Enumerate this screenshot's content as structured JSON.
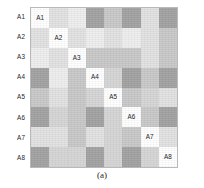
{
  "figure": {
    "caption": "(a)",
    "row_labels": [
      "A1",
      "A2",
      "A3",
      "A4",
      "A5",
      "A6",
      "A7",
      "A8"
    ],
    "diagonal_labels": [
      "A1",
      "A2",
      "A3",
      "A4",
      "A5",
      "A6",
      "A7",
      "A8"
    ],
    "colors": {
      "white": "#ffffff",
      "very_light": "#eeeeee",
      "light": "#e2e2e2",
      "light_medium": "#d6d6d6",
      "medium": "#c9c9c9",
      "medium_dark": "#bdbdbd",
      "dark": "#a3a3a3",
      "border": "#b9b9b9",
      "text": "#25252a"
    }
  },
  "chart_data": {
    "type": "heatmap",
    "title": "",
    "subtitle": "",
    "xlabel": "",
    "ylabel": "",
    "caption": "(a)",
    "grid": true,
    "legend": "none",
    "rows": 8,
    "cols": 8,
    "row_categories": [
      "A1",
      "A2",
      "A3",
      "A4",
      "A5",
      "A6",
      "A7",
      "A8"
    ],
    "col_categories": [
      "A1",
      "A2",
      "A3",
      "A4",
      "A5",
      "A6",
      "A7",
      "A8"
    ],
    "value_range": [
      0,
      1
    ],
    "colormap": "grayscale (0 = dark gray, 1 = white)",
    "cell_labels": [
      [
        "A1",
        "",
        "",
        "",
        "",
        "",
        "",
        ""
      ],
      [
        "",
        "A2",
        "",
        "",
        "",
        "",
        "",
        ""
      ],
      [
        "",
        "",
        "A3",
        "",
        "",
        "",
        "",
        ""
      ],
      [
        "",
        "",
        "",
        "A4",
        "",
        "",
        "",
        ""
      ],
      [
        "",
        "",
        "",
        "",
        "A5",
        "",
        "",
        ""
      ],
      [
        "",
        "",
        "",
        "",
        "",
        "A6",
        "",
        ""
      ],
      [
        "",
        "",
        "",
        "",
        "",
        "",
        "A7",
        ""
      ],
      [
        "",
        "",
        "",
        "",
        "",
        "",
        "",
        "A8"
      ]
    ],
    "values": [
      [
        1.0,
        0.82,
        0.93,
        0.4,
        0.74,
        0.4,
        0.82,
        0.4
      ],
      [
        0.82,
        1.0,
        0.82,
        0.93,
        0.82,
        0.93,
        0.82,
        0.74
      ],
      [
        0.93,
        0.82,
        1.0,
        0.74,
        0.74,
        0.74,
        0.82,
        0.74
      ],
      [
        0.4,
        0.93,
        0.74,
        1.0,
        0.88,
        0.4,
        0.74,
        0.4
      ],
      [
        0.74,
        0.82,
        0.74,
        0.88,
        1.0,
        0.74,
        0.88,
        0.82
      ],
      [
        0.4,
        0.88,
        0.74,
        0.4,
        0.88,
        1.0,
        0.74,
        0.4
      ],
      [
        0.82,
        0.82,
        0.74,
        0.82,
        0.88,
        0.74,
        1.0,
        0.82
      ],
      [
        0.4,
        0.88,
        0.88,
        0.4,
        0.88,
        0.4,
        0.88,
        1.0
      ]
    ],
    "cell_colors": [
      [
        "#ffffff",
        "#e2e2e2",
        "#eeeeee",
        "#a3a3a3",
        "#c9c9c9",
        "#a3a3a3",
        "#e2e2e2",
        "#a3a3a3"
      ],
      [
        "#e2e2e2",
        "#ffffff",
        "#e2e2e2",
        "#eeeeee",
        "#e2e2e2",
        "#eeeeee",
        "#e2e2e2",
        "#c9c9c9"
      ],
      [
        "#eeeeee",
        "#e2e2e2",
        "#ffffff",
        "#c9c9c9",
        "#c9c9c9",
        "#c9c9c9",
        "#e2e2e2",
        "#c9c9c9"
      ],
      [
        "#a3a3a3",
        "#eeeeee",
        "#c9c9c9",
        "#ffffff",
        "#d6d6d6",
        "#a3a3a3",
        "#c9c9c9",
        "#a3a3a3"
      ],
      [
        "#c9c9c9",
        "#e2e2e2",
        "#c9c9c9",
        "#d6d6d6",
        "#ffffff",
        "#c9c9c9",
        "#d6d6d6",
        "#e2e2e2"
      ],
      [
        "#a3a3a3",
        "#d6d6d6",
        "#c9c9c9",
        "#a3a3a3",
        "#d6d6d6",
        "#ffffff",
        "#c9c9c9",
        "#a3a3a3"
      ],
      [
        "#e2e2e2",
        "#e2e2e2",
        "#c9c9c9",
        "#e2e2e2",
        "#d6d6d6",
        "#c9c9c9",
        "#ffffff",
        "#e2e2e2"
      ],
      [
        "#a3a3a3",
        "#d6d6d6",
        "#d6d6d6",
        "#a3a3a3",
        "#d6d6d6",
        "#a3a3a3",
        "#d6d6d6",
        "#ffffff"
      ]
    ]
  }
}
